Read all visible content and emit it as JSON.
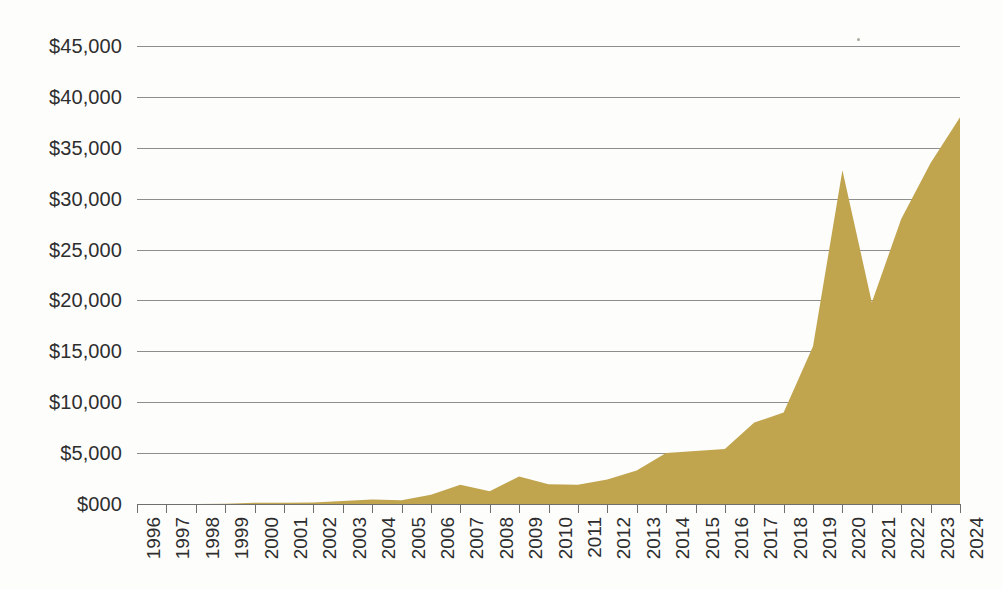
{
  "chart_data": {
    "type": "area",
    "title": "",
    "subtitle": "",
    "xlabel": "",
    "ylabel": "",
    "legend": [],
    "legend_position": "none",
    "grid": true,
    "grid_axis": "y",
    "ylim": [
      0,
      45000
    ],
    "ytick_step": 5000,
    "ytick_labels": [
      "$45,000",
      "$40,000",
      "$35,000",
      "$30,000",
      "$25,000",
      "$20,000",
      "$15,000",
      "$10,000",
      "$5,000",
      "$000"
    ],
    "ytick_values": [
      45000,
      40000,
      35000,
      30000,
      25000,
      20000,
      15000,
      10000,
      5000,
      0
    ],
    "categories": [
      "1996",
      "1997",
      "1998",
      "1999",
      "2000",
      "2001",
      "2002",
      "2003",
      "2004",
      "2005",
      "2006",
      "2007",
      "2008",
      "2009",
      "2010",
      "2011",
      "2012",
      "2013",
      "2014",
      "2015",
      "2016",
      "2017",
      "2018",
      "2019",
      "2020",
      "2021",
      "2022",
      "2023",
      "2024"
    ],
    "values": [
      0,
      0,
      0,
      30,
      120,
      130,
      140,
      300,
      450,
      380,
      900,
      1900,
      1250,
      2700,
      1950,
      1900,
      2400,
      3300,
      5000,
      5200,
      5400,
      8000,
      9000,
      15500,
      32800,
      19800,
      28000,
      33500,
      38000
    ],
    "series_name": "",
    "fill_color": "#C0A44E",
    "grid_color": "#8d8d8d",
    "axis_color": "#6f6f6f",
    "text_color": "#2e2e2e",
    "background_color": "#fdfdfc"
  }
}
